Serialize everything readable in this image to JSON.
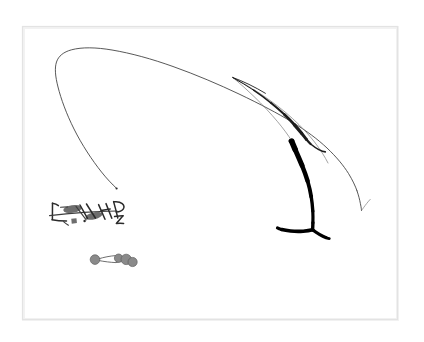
{
  "artwork": {
    "title": "Untitled abstract ink drawing",
    "medium": "ink on paper",
    "background_color": "#ffffff",
    "frame": {
      "name": "inner-frame-border",
      "color": "#e3e3e3",
      "x": 22,
      "y": 26,
      "width": 376,
      "height": 294
    },
    "palette": {
      "ink_black": "#000000",
      "ink_dark": "#1c1c1c",
      "ink_mid": "#3a3a3a",
      "ink_faint": "#7b7b7b",
      "gray_fill": "#8a8a8a",
      "blob_gray": "#6e6e6e",
      "paper": "#ffffff"
    },
    "elements": [
      {
        "id": "long-thin-arc",
        "name": "long-thin-sweeping-arc",
        "description": "Very fine hairline arc sweeping from lower-left up over the top and down to the right edge, ending in a small hook",
        "stroke_weight": "hairline",
        "color": "#3a3a3a"
      },
      {
        "id": "secondary-arc",
        "name": "secondary-faint-arc",
        "description": "Fainter parallel arc descending to the right, ending in a small V tick",
        "stroke_weight": "hairline",
        "color": "#7b7b7b"
      },
      {
        "id": "calligraphic-stroke",
        "name": "dark-calligraphic-diagonal-stroke",
        "description": "Dark tapering diagonal stroke, sharp at upper-left, thickening as it curves down to the right",
        "stroke_weight": "medium",
        "color": "#1c1c1c"
      },
      {
        "id": "thick-hook",
        "name": "thick-black-hook-stroke",
        "description": "Heavy black stroke curving down from a blunt top, terminating in a horizontal Y-shaped foot",
        "stroke_weight": "heavy",
        "color": "#000000"
      },
      {
        "id": "glyph-cluster",
        "name": "glyph-mark-cluster",
        "description": "Cluster of small angular calligraphic glyph-like marks with two filled gray lozenges",
        "stroke_weight": "fine",
        "color": "#2b2b2b",
        "mark_count": 12
      },
      {
        "id": "dot-chain",
        "name": "gray-dot-chain",
        "description": "Four gray filled circles linked by thin connecting lines",
        "color": "#8a8a8a",
        "dot_count": 4
      }
    ]
  }
}
